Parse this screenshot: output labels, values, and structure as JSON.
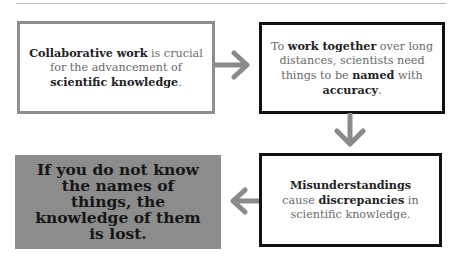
{
  "diagram": {
    "type": "flow",
    "colors": {
      "background": "#ffffff",
      "gray_border": "#8e8e8e",
      "black_border": "#111111",
      "highlight_fill": "#8c8c8c",
      "arrow": "#8a8a8a",
      "body_text": "#6a6a6a",
      "bold_text": "#222222"
    },
    "boxes": [
      {
        "id": "box1",
        "style": "gray-border",
        "segments": [
          {
            "text": "Collaborative work",
            "bold": true
          },
          {
            "text": " is crucial for the advancement of ",
            "bold": false
          },
          {
            "text": "scientific knowledge",
            "bold": true
          },
          {
            "text": ".",
            "bold": false
          }
        ]
      },
      {
        "id": "box2",
        "style": "black-border",
        "segments": [
          {
            "text": "To ",
            "bold": false
          },
          {
            "text": "work together",
            "bold": true
          },
          {
            "text": " over long distances, scientists need things to be ",
            "bold": false
          },
          {
            "text": "named",
            "bold": true
          },
          {
            "text": " with ",
            "bold": false
          },
          {
            "text": "accuracy",
            "bold": true
          },
          {
            "text": ".",
            "bold": false
          }
        ]
      },
      {
        "id": "box3",
        "style": "gray-fill",
        "segments": [
          {
            "text": "If you do not know the names of things, the knowledge of them is lost.",
            "bold": true
          }
        ]
      },
      {
        "id": "box4",
        "style": "black-border",
        "segments": [
          {
            "text": "Misunderstandings",
            "bold": true
          },
          {
            "text": " cause ",
            "bold": false
          },
          {
            "text": "discrepancies",
            "bold": true
          },
          {
            "text": " in scientific knowledge.",
            "bold": false
          }
        ]
      }
    ],
    "arrows": [
      {
        "from": "box1",
        "to": "box2",
        "direction": "right"
      },
      {
        "from": "box2",
        "to": "box4",
        "direction": "down"
      },
      {
        "from": "box4",
        "to": "box3",
        "direction": "left"
      }
    ]
  }
}
